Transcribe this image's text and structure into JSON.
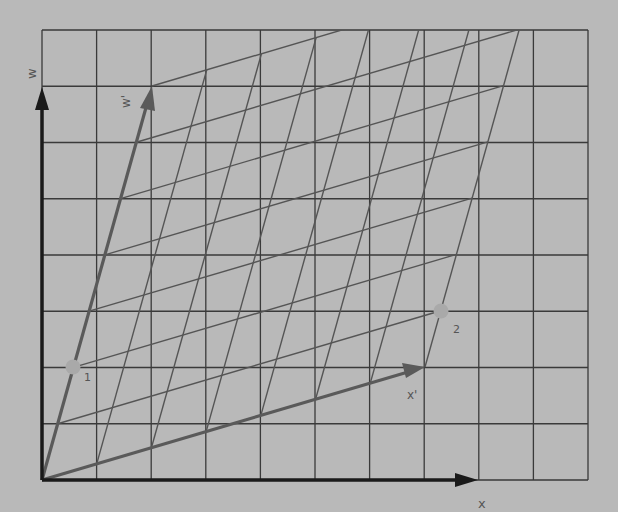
{
  "diagram": {
    "title": "",
    "colors": {
      "background": "#b9b9b9",
      "grid": "#3a3a3a",
      "skewed_grid": "#555555",
      "axes": "#1a1a1a",
      "basis_vectors": "#5a5a5a",
      "points": "#a9a9a9"
    },
    "grid": {
      "columns": 10,
      "rows": 8,
      "x_min": 42,
      "x_max": 588,
      "y_min": 30,
      "y_max": 480
    },
    "axes": {
      "x_label": "x",
      "w_label": "w"
    },
    "basis_vectors": {
      "x_prime_label": "x'",
      "w_prime_label": "w'",
      "skew_divisions": 7
    },
    "points": [
      {
        "label": "1",
        "x": 73,
        "y": 367
      },
      {
        "label": "2",
        "x": 441,
        "y": 311
      }
    ]
  }
}
